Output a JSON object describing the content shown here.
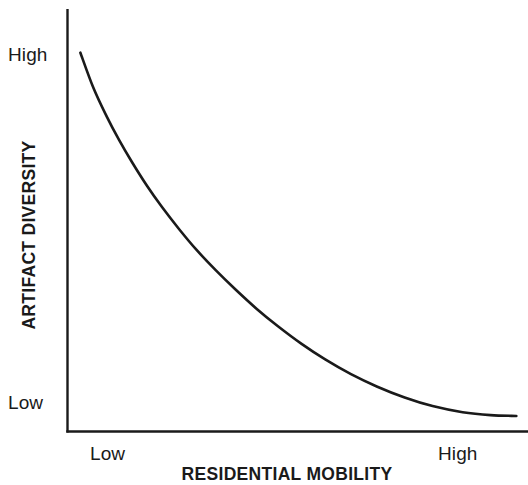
{
  "chart_data": {
    "type": "line",
    "title": "",
    "subtitle": "",
    "xlabel": "RESIDENTIAL MOBILITY",
    "ylabel": "ARTIFACT DIVERSITY",
    "x_tick_labels": [
      "Low",
      "High"
    ],
    "y_tick_labels": [
      "Low",
      "High"
    ],
    "xlim": [
      0,
      1
    ],
    "ylim": [
      0,
      1
    ],
    "grid": false,
    "legend": "none",
    "annotations": [],
    "line_color": "#1a1a1a",
    "background_color": "#ffffff",
    "series": [
      {
        "name": "artifact diversity",
        "x": [
          0.03,
          0.06,
          0.09,
          0.12,
          0.15,
          0.185,
          0.22,
          0.26,
          0.3,
          0.345,
          0.39,
          0.44,
          0.49,
          0.545,
          0.6,
          0.66,
          0.72,
          0.785,
          0.85,
          0.92,
          0.985,
          1.045
        ],
        "y": [
          0.925,
          0.84,
          0.772,
          0.712,
          0.658,
          0.6,
          0.548,
          0.494,
          0.444,
          0.394,
          0.348,
          0.3,
          0.257,
          0.214,
          0.176,
          0.14,
          0.11,
          0.083,
          0.062,
          0.047,
          0.04,
          0.038
        ]
      }
    ]
  },
  "axes": {
    "y_high_label": "High",
    "y_low_label": "Low",
    "x_low_label": "Low",
    "x_high_label": "High",
    "y_title": "ARTIFACT DIVERSITY",
    "x_title": "RESIDENTIAL MOBILITY"
  }
}
